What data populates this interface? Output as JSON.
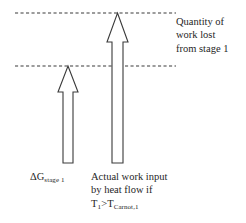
{
  "figure": {
    "title_text": "",
    "background_color": "#ffffff",
    "stroke_color": "#3a3a3a",
    "text_color": "#262626",
    "reference_lines": [
      {
        "name": "upper-reference-line",
        "y": 13,
        "x_start": 15,
        "x_end": 176,
        "style": "dashed"
      },
      {
        "name": "lower-reference-line",
        "y": 66,
        "x_start": 15,
        "x_end": 176,
        "style": "dashed"
      }
    ],
    "arrows": [
      {
        "name": "delta-g-arrow",
        "direction": "up",
        "tip_y": 66,
        "base_y": 163,
        "shaft_left": 63,
        "shaft_right": 73,
        "head_left": 58,
        "head_right": 78,
        "head_bottom_y": 92
      },
      {
        "name": "actual-work-arrow",
        "direction": "up",
        "tip_y": 13,
        "base_y": 163,
        "shaft_left": 112,
        "shaft_right": 123,
        "head_left": 107,
        "head_right": 128,
        "head_bottom_y": 42
      }
    ]
  },
  "labels": {
    "work_lost": {
      "name": "work-lost-caption",
      "lines": [
        "Quantity of",
        "work lost",
        "from stage 1"
      ],
      "full_text": "Quantity of work lost from stage 1"
    },
    "delta_g": {
      "name": "delta-g-label",
      "symbol": "ΔG",
      "subscript": "stage 1",
      "full_text": "ΔGstage 1"
    },
    "actual_work": {
      "name": "actual-work-caption",
      "line1": "Actual work input",
      "line2": "by heat flow if",
      "condition": {
        "lhs_symbol": "T",
        "lhs_subscript": "1",
        "operator": ">",
        "rhs_symbol": "T",
        "rhs_subscript": "Carnot,1"
      },
      "full_text": "Actual work input by heat flow if T1>TCarnot,1"
    }
  }
}
